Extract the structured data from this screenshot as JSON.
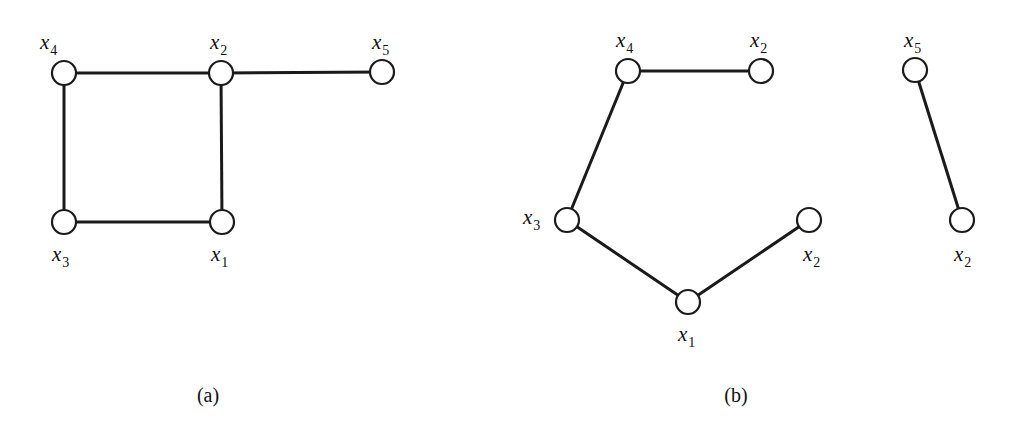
{
  "figure": {
    "panels": [
      {
        "id": "a",
        "caption": "(a)",
        "nodes": [
          {
            "id": "a_x4",
            "name": "x",
            "sub": "4"
          },
          {
            "id": "a_x2",
            "name": "x",
            "sub": "2"
          },
          {
            "id": "a_x5",
            "name": "x",
            "sub": "5"
          },
          {
            "id": "a_x3",
            "name": "x",
            "sub": "3"
          },
          {
            "id": "a_x1",
            "name": "x",
            "sub": "1"
          }
        ],
        "edges": [
          [
            "a_x4",
            "a_x2"
          ],
          [
            "a_x2",
            "a_x5"
          ],
          [
            "a_x4",
            "a_x3"
          ],
          [
            "a_x2",
            "a_x1"
          ],
          [
            "a_x3",
            "a_x1"
          ]
        ]
      },
      {
        "id": "b",
        "caption": "(b)",
        "nodes": [
          {
            "id": "b_x4",
            "name": "x",
            "sub": "4"
          },
          {
            "id": "b_x2a",
            "name": "x",
            "sub": "2"
          },
          {
            "id": "b_x3",
            "name": "x",
            "sub": "3"
          },
          {
            "id": "b_x2b",
            "name": "x",
            "sub": "2"
          },
          {
            "id": "b_x1",
            "name": "x",
            "sub": "1"
          },
          {
            "id": "b_x5",
            "name": "x",
            "sub": "5"
          },
          {
            "id": "b_x2c",
            "name": "x",
            "sub": "2"
          }
        ],
        "edges": [
          [
            "b_x4",
            "b_x2a"
          ],
          [
            "b_x4",
            "b_x3"
          ],
          [
            "b_x3",
            "b_x1"
          ],
          [
            "b_x1",
            "b_x2b"
          ],
          [
            "b_x5",
            "b_x2c"
          ]
        ]
      }
    ]
  }
}
